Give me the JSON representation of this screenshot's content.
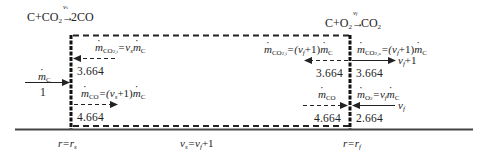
{
  "diagram": {
    "type": "carbon particle combustion two-film model",
    "reactions": {
      "surface": {
        "label": "C+CO2 → 2CO",
        "lhs": "C+CO",
        "lhs_sub": "2",
        "rhs": "2CO",
        "coeff": "ν",
        "coeff_sub": "s"
      },
      "flame": {
        "label": "C+O2 → CO2",
        "lhs": "C+O",
        "lhs_sub": "2",
        "rhs": "CO",
        "rhs_sub": "2",
        "coeff": "ν",
        "coeff_sub": "f"
      }
    },
    "surface_side": {
      "inflow_label": "ṁ_C",
      "inflow_label_m": "m",
      "inflow_label_sub": "C",
      "inflow_value": "1",
      "co2_in": {
        "m": "m",
        "sub": "CO",
        "sub2": "2,i",
        "eq": "=ν",
        "eq_sub": "s",
        "tail_m": "m",
        "tail_sub": "C",
        "label": "ṁ_CO2,i = ν_s ṁ_C",
        "value": "3.664"
      },
      "co_out": {
        "m": "m",
        "sub": "CO",
        "eq": "=(ν",
        "eq_sub": "s",
        "eq_tail": "+1)",
        "tail_m": "m",
        "tail_sub": "C",
        "label": "ṁ_CO = (ν_s+1) ṁ_C",
        "value": "4.664"
      }
    },
    "flame_side": {
      "co2_inner": {
        "m": "m",
        "sub": "CO",
        "sub2": "2,i",
        "eq": "=(ν",
        "eq_sub": "f",
        "eq_tail": "+1)",
        "tail_m": "m",
        "tail_sub": "C",
        "label": "ṁ_CO2,i = (ν_f+1) ṁ_C",
        "value": "3.664"
      },
      "co2_outer": {
        "m": "m",
        "sub": "CO",
        "sub2": "2,o",
        "eq": "=(ν",
        "eq_sub": "f",
        "eq_tail": "+1)",
        "tail_m": "m",
        "tail_sub": "C",
        "label": "ṁ_CO2,o = (ν_f+1) ṁ_C",
        "value": "3.664",
        "arrow_label": "ν",
        "arrow_label_sub": "f",
        "arrow_label_tail": "+1"
      },
      "co_in": {
        "m": "m",
        "sub": "CO",
        "label": "ṁ_CO",
        "value": "4.664"
      },
      "o2_in": {
        "m": "m",
        "sub": "O",
        "sub2": "2",
        "eq": "=ν",
        "eq_sub": "f",
        "tail_m": "m",
        "tail_sub": "C",
        "label": "ṁ_O2 = ν_f ṁ_C",
        "value": "2.664",
        "arrow_label": "ν",
        "arrow_label_sub": "f"
      }
    },
    "axis": {
      "left": {
        "label": "r=r_s",
        "r": "r",
        "eq": "=r",
        "sub": "s"
      },
      "middle": {
        "label": "ν_s = ν_f + 1",
        "a": "ν",
        "a_sub": "s",
        "eq": "=ν",
        "b_sub": "f",
        "tail": "+1"
      },
      "right": {
        "label": "r=r_f",
        "r": "r",
        "eq": "=r",
        "sub": "f"
      }
    }
  }
}
